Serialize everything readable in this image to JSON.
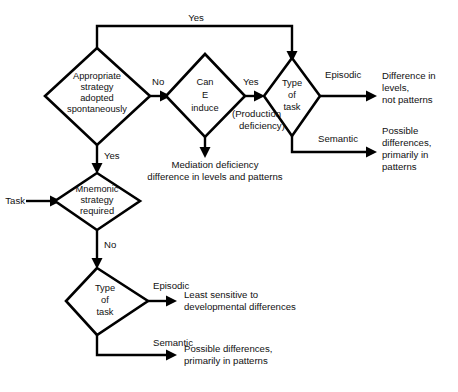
{
  "diagram": {
    "background_color": "#ffffff",
    "line_color": "#000000",
    "text_color": "#111111"
  },
  "entry": {
    "label": "Task"
  },
  "nodes": {
    "appropriate_strategy": {
      "line1": "Appropriate",
      "line2": "strategy",
      "line3": "adopted",
      "line4": "spontaneously"
    },
    "can_e_induce": {
      "line1": "Can",
      "line2": "E",
      "line3": "induce"
    },
    "type_of_task_top": {
      "line1": "Type",
      "line2": "of",
      "line3": "task"
    },
    "mnemonic_strategy": {
      "line1": "Mnemonic",
      "line2": "strategy",
      "line3": "required"
    },
    "type_of_task_bottom": {
      "line1": "Type",
      "line2": "of",
      "line3": "task"
    }
  },
  "edges": {
    "strategy_yes_top": "Yes",
    "strategy_no": "No",
    "strategy_yes_down": "Yes",
    "induce_yes": "Yes",
    "induce_yes_note_line1": "(Production",
    "induce_yes_note_line2": "deficiency)",
    "top_task_episodic": "Episodic",
    "top_task_semantic": "Semantic",
    "mnemonic_no": "No",
    "bottom_task_episodic": "Episodic",
    "bottom_task_semantic": "Semantic"
  },
  "outcomes": {
    "mediation_deficiency": {
      "line1": "Mediation deficiency",
      "line2": "difference in levels and patterns"
    },
    "difference_levels": {
      "line1": "Difference in",
      "line2": "levels,",
      "line3": "not patterns"
    },
    "possible_differences_top": {
      "line1": "Possible",
      "line2": "differences,",
      "line3": "primarily in",
      "line4": "patterns"
    },
    "least_sensitive": {
      "line1": "Least sensitive to",
      "line2": "developmental differences"
    },
    "possible_differences_bottom": {
      "line1": "Possible differences,",
      "line2": "primarily in patterns"
    }
  }
}
